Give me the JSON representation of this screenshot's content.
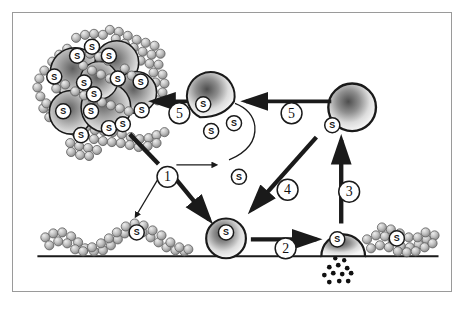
{
  "figure": {
    "caption": "",
    "frame_color": "#9a9a9a",
    "background": "#ffffff"
  },
  "palette": {
    "ink": "#1a1a1a",
    "bead_fill": "#b9b9b9",
    "bead_stroke": "#5a5a5a",
    "vesicle_center": "#6e6e6e",
    "vesicle_edge": "#f2f2f2",
    "label_fill": "#ffffff",
    "granule": "#111111"
  },
  "legend": {
    "receptor_symbol": "S",
    "step_numbers": [
      "1",
      "2",
      "3",
      "4",
      "5"
    ]
  },
  "steps": [
    {
      "id": "step-1",
      "label": "1",
      "x": 155,
      "y": 165
    },
    {
      "id": "step-2",
      "label": "2",
      "x": 274,
      "y": 237
    },
    {
      "id": "step-3",
      "label": "3",
      "x": 338,
      "y": 180
    },
    {
      "id": "step-4",
      "label": "4",
      "x": 276,
      "y": 178
    },
    {
      "id": "step-5a",
      "label": "5",
      "x": 167,
      "y": 101
    },
    {
      "id": "step-5b",
      "label": "5",
      "x": 280,
      "y": 101
    }
  ],
  "receptors": [
    {
      "id": "receptor-cluster-1",
      "label": "S",
      "x": 79,
      "y": 34
    },
    {
      "id": "receptor-cluster-2",
      "label": "S",
      "x": 64,
      "y": 43
    },
    {
      "id": "receptor-cluster-3",
      "label": "S",
      "x": 96,
      "y": 43
    },
    {
      "id": "receptor-cluster-4",
      "label": "S",
      "x": 41,
      "y": 64
    },
    {
      "id": "receptor-cluster-5",
      "label": "S",
      "x": 105,
      "y": 66
    },
    {
      "id": "receptor-cluster-6",
      "label": "S",
      "x": 81,
      "y": 82
    },
    {
      "id": "receptor-cluster-7",
      "label": "S",
      "x": 71,
      "y": 70
    },
    {
      "id": "receptor-cluster-8",
      "label": "S",
      "x": 128,
      "y": 69
    },
    {
      "id": "receptor-cluster-9",
      "label": "S",
      "x": 129,
      "y": 98
    },
    {
      "id": "receptor-cluster-10",
      "label": "S",
      "x": 50,
      "y": 99
    },
    {
      "id": "receptor-cluster-11",
      "label": "S",
      "x": 78,
      "y": 99
    },
    {
      "id": "receptor-cluster-12",
      "label": "S",
      "x": 68,
      "y": 123
    },
    {
      "id": "receptor-cluster-13",
      "label": "S",
      "x": 96,
      "y": 116
    },
    {
      "id": "receptor-cluster-14",
      "label": "S",
      "x": 110,
      "y": 112
    },
    {
      "id": "receptor-vesicle-a1",
      "label": "S",
      "x": 191,
      "y": 92
    },
    {
      "id": "receptor-vesicle-a2",
      "label": "S",
      "x": 199,
      "y": 119
    },
    {
      "id": "receptor-vesicle-a3",
      "label": "S",
      "x": 222,
      "y": 111
    },
    {
      "id": "receptor-free",
      "label": "S",
      "x": 227,
      "y": 165
    },
    {
      "id": "receptor-vesicle-b",
      "label": "S",
      "x": 321,
      "y": 113
    },
    {
      "id": "receptor-chain-left",
      "label": "S",
      "x": 124,
      "y": 221
    },
    {
      "id": "receptor-vesicle-bud",
      "label": "S",
      "x": 214,
      "y": 221
    },
    {
      "id": "receptor-vesicle-fuse",
      "label": "S",
      "x": 326,
      "y": 228
    },
    {
      "id": "receptor-chain-right",
      "label": "S",
      "x": 386,
      "y": 227
    }
  ],
  "objects": [
    {
      "id": "receptor-cluster-aggregate",
      "name": "clustered-vesicle-aggregate"
    },
    {
      "id": "vesicle-multireceptor",
      "name": "multi-receptor-vesicle"
    },
    {
      "id": "vesicle-internalized",
      "name": "internalized-vesicle"
    },
    {
      "id": "vesicle-budding",
      "name": "budding-vesicle"
    },
    {
      "id": "vesicle-fusing",
      "name": "fusing-vesicle"
    },
    {
      "id": "membrane",
      "name": "plasma-membrane-line"
    },
    {
      "id": "granule-release",
      "name": "released-granules"
    },
    {
      "id": "polymer-chain-left",
      "name": "bead-chain-left"
    },
    {
      "id": "polymer-chain-right",
      "name": "bead-chain-right"
    }
  ]
}
